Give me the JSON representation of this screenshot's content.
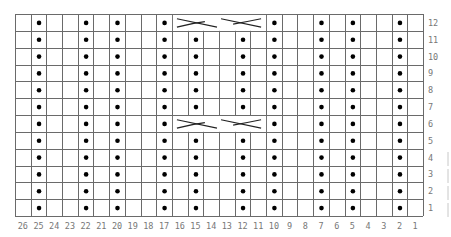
{
  "chart": {
    "title": "",
    "type": "knitting-chart",
    "columns": 26,
    "rows": 12,
    "column_labels": [
      "26",
      "25",
      "24",
      "23",
      "22",
      "21",
      "20",
      "19",
      "18",
      "17",
      "16",
      "15",
      "14",
      "13",
      "12",
      "11",
      "10",
      "9",
      "8",
      "7",
      "6",
      "5",
      "4",
      "3",
      "2",
      "1"
    ],
    "row_labels": [
      "12",
      "11",
      "10",
      "9",
      "8",
      "7",
      "6",
      "5",
      "4",
      "3",
      "2",
      "1"
    ],
    "purl_columns": [
      25,
      22,
      20,
      17,
      15,
      12,
      10,
      7,
      5,
      2
    ],
    "cable_rows": [
      6,
      12
    ],
    "cable_span": {
      "from_column": 16,
      "to_column": 11
    },
    "symbols": {
      "purl": "dot",
      "knit": "blank",
      "cable": "6-stitch cable cross"
    },
    "colors": {
      "grid": "#6a6a6a",
      "dot": "#000000",
      "label": "#777777"
    }
  }
}
